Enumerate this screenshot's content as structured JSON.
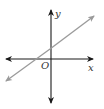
{
  "diagram": {
    "type": "coordinate-plane",
    "axes": {
      "x_label": "x",
      "y_label": "y",
      "origin_label": "O",
      "axis_color": "#1a1a1a"
    },
    "line": {
      "description": "line with positive slope and positive y-intercept",
      "color": "#9a9a9a"
    }
  }
}
